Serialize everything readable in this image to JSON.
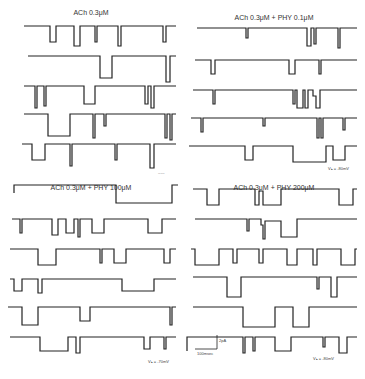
{
  "figure": {
    "panels": [
      {
        "id": "A",
        "title": "ACh 0.3μM",
        "note": "-----",
        "traces": 5
      },
      {
        "id": "B",
        "title": "ACh 0.3μM + PHY 0.1μM",
        "note": "Vₕ = -80mV",
        "traces": 5
      },
      {
        "id": "C",
        "title": "ACh 0.3μM + PHY 100μM",
        "note": "Vₕ = -70mV",
        "traces": 6
      },
      {
        "id": "D",
        "title": "ACh 0.3μM + PHY 200μM",
        "note": "Vₕ = -80mV",
        "traces": 6
      }
    ],
    "scale_bar": {
      "current": "2pA",
      "time": "100msec"
    }
  }
}
